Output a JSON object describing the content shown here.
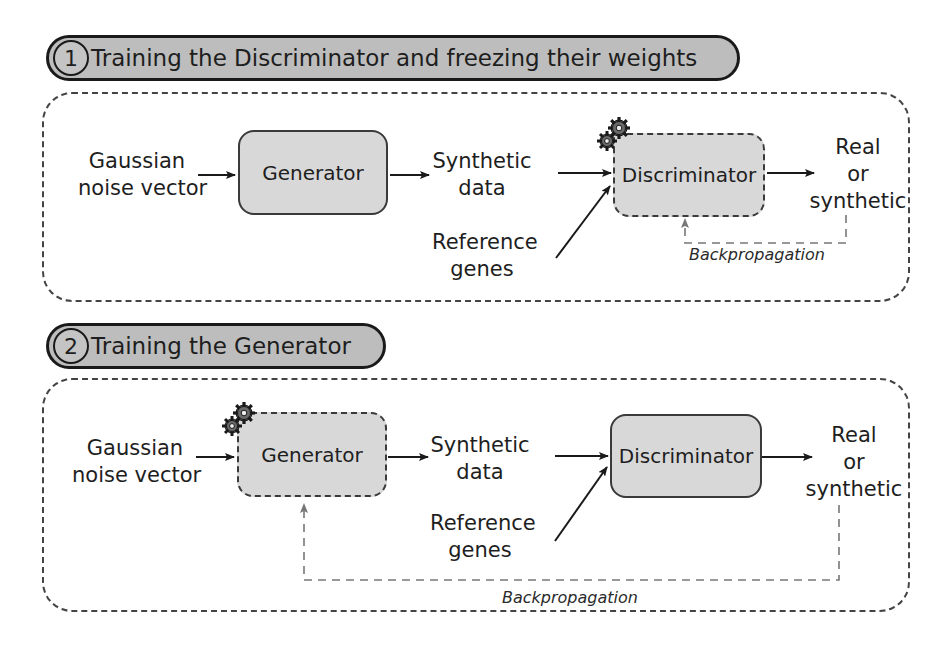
{
  "panels": [
    {
      "step_number": "1",
      "title": "Training the Discriminator and freezing their weights",
      "input_label_line1": "Gaussian",
      "input_label_line2": "noise vector",
      "generator": {
        "label": "Generator",
        "trainable": false,
        "border": "solid"
      },
      "synthetic_label_line1": "Synthetic",
      "synthetic_label_line2": "data",
      "reference_label_line1": "Reference",
      "reference_label_line2": "genes",
      "discriminator": {
        "label": "Discriminator",
        "trainable": true,
        "border": "dashed"
      },
      "output_line1": "Real",
      "output_line2": "or",
      "output_line3": "synthetic",
      "backprop_label": "Backpropagation",
      "backprop_target": "Discriminator",
      "trainable_icon": "gear-icon"
    },
    {
      "step_number": "2",
      "title": "Training the Generator",
      "input_label_line1": "Gaussian",
      "input_label_line2": "noise vector",
      "generator": {
        "label": "Generator",
        "trainable": true,
        "border": "dashed"
      },
      "synthetic_label_line1": "Synthetic",
      "synthetic_label_line2": "data",
      "reference_label_line1": "Reference",
      "reference_label_line2": "genes",
      "discriminator": {
        "label": "Discriminator",
        "trainable": false,
        "border": "solid"
      },
      "output_line1": "Real",
      "output_line2": "or",
      "output_line3": "synthetic",
      "backprop_label": "Backpropagation",
      "backprop_target": "Generator",
      "trainable_icon": "gear-icon"
    }
  ],
  "colors": {
    "box_fill": "#d8d8d8",
    "pill_fill": "#bdbdbd",
    "stroke": "#1a1a1a",
    "backprop_stroke": "#666666"
  }
}
